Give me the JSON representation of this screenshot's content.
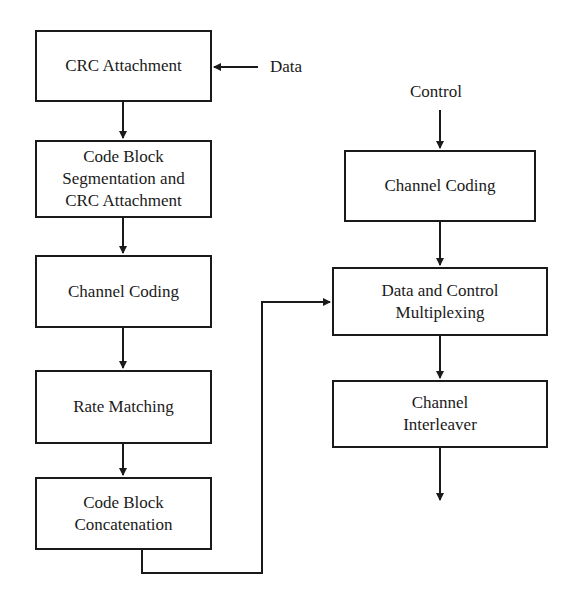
{
  "diagram": {
    "title": "",
    "inputs": {
      "data_label": "Data",
      "control_label": "Control"
    },
    "data_chain": [
      {
        "id": "crc-attachment",
        "label": "CRC Attachment"
      },
      {
        "id": "code-block-segmentation",
        "label": "Code Block Segmentation and CRC Attachment"
      },
      {
        "id": "channel-coding-data",
        "label": "Channel Coding"
      },
      {
        "id": "rate-matching",
        "label": "Rate Matching"
      },
      {
        "id": "code-block-concatenation",
        "label": "Code Block Concatenation"
      }
    ],
    "control_chain": [
      {
        "id": "channel-coding-control",
        "label": "Channel Coding"
      },
      {
        "id": "data-control-multiplexing",
        "label": "Data and Control Multiplexing"
      },
      {
        "id": "channel-interleaver",
        "label": "Channel Interleaver"
      }
    ],
    "edges": [
      {
        "from": "Data",
        "to": "crc-attachment"
      },
      {
        "from": "crc-attachment",
        "to": "code-block-segmentation"
      },
      {
        "from": "code-block-segmentation",
        "to": "channel-coding-data"
      },
      {
        "from": "channel-coding-data",
        "to": "rate-matching"
      },
      {
        "from": "rate-matching",
        "to": "code-block-concatenation"
      },
      {
        "from": "code-block-concatenation",
        "to": "data-control-multiplexing"
      },
      {
        "from": "Control",
        "to": "channel-coding-control"
      },
      {
        "from": "channel-coding-control",
        "to": "data-control-multiplexing"
      },
      {
        "from": "data-control-multiplexing",
        "to": "channel-interleaver"
      },
      {
        "from": "channel-interleaver",
        "to": "output"
      }
    ],
    "colors": {
      "line": "#1a1a1a",
      "background": "#ffffff"
    }
  }
}
